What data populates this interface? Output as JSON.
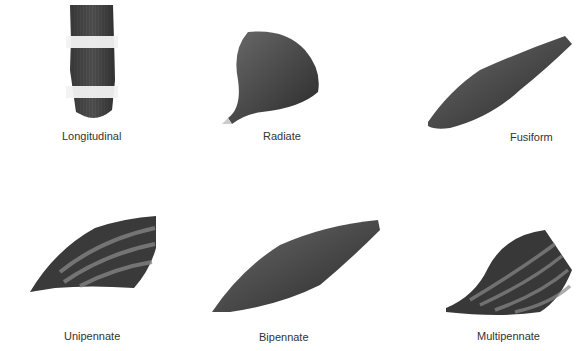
{
  "diagram": {
    "title": "",
    "muscles": [
      {
        "id": "longitudinal",
        "label": "Longitudinal"
      },
      {
        "id": "radiate",
        "label": "Radiate"
      },
      {
        "id": "fusiform",
        "label": "Fusiform"
      },
      {
        "id": "unipennate",
        "label": "Unipennate"
      },
      {
        "id": "bipennate",
        "label": "Bipennate"
      },
      {
        "id": "multipennate",
        "label": "Multipennate"
      }
    ],
    "colors": {
      "muscle_dark": "#2e2e2e",
      "muscle_mid": "#5a5a5a",
      "band_light": "#e8e8e8",
      "label": "#333333",
      "background": "#ffffff"
    }
  }
}
